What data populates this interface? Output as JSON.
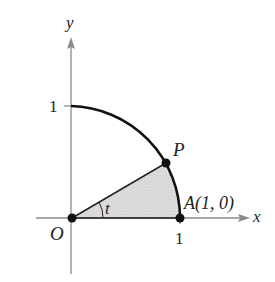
{
  "diagram": {
    "axes": {
      "x_label": "x",
      "y_label": "y"
    },
    "ticks": {
      "x_one": "1",
      "y_one": "1"
    },
    "points": {
      "origin": "O",
      "p": "P",
      "a": "A(1, 0)"
    },
    "angle_label": "t",
    "colors": {
      "axis": "#8a8a8a",
      "arc": "#111111",
      "sector_fill": "#d9d9d9"
    }
  }
}
